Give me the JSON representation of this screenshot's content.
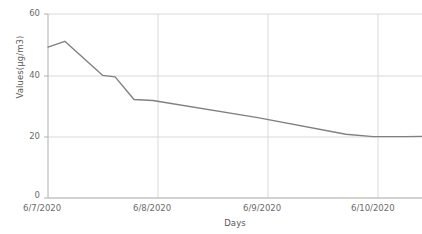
{
  "chart_data": {
    "type": "line",
    "title": "",
    "xlabel": "Days",
    "ylabel": "Values(µg/m3)",
    "grid": true,
    "legend": false,
    "line_color": "#808080",
    "grid_color": "#d9d9d9",
    "axis_color": "#a6a6a6",
    "text_color": "#6b6b6b",
    "background": "#ffffff",
    "xlim": [
      0,
      3.566
    ],
    "ylim": [
      0,
      60
    ],
    "yticks": [
      0,
      20,
      40,
      60
    ],
    "ytick_labels": [
      "0",
      "20",
      "40",
      "60"
    ],
    "xticks": [
      0,
      1,
      2,
      3
    ],
    "xtick_labels": [
      "6/7/2020",
      "6/8/2020",
      "6/9/2020",
      "6/10/2020"
    ],
    "x": [
      0.0,
      0.16,
      0.52,
      0.64,
      0.82,
      1.0,
      2.0,
      2.84,
      3.1,
      3.4,
      3.566
    ],
    "values": [
      49.2,
      51.1,
      40.0,
      39.5,
      32.1,
      31.8,
      26.2,
      20.8,
      20.0,
      20.0,
      20.1
    ],
    "series": [
      {
        "name": "Values",
        "points": [
          {
            "x": 0.0,
            "y": 49.2
          },
          {
            "x": 0.16,
            "y": 51.1
          },
          {
            "x": 0.52,
            "y": 40.0
          },
          {
            "x": 0.64,
            "y": 39.5
          },
          {
            "x": 0.82,
            "y": 32.1
          },
          {
            "x": 1.0,
            "y": 31.8
          },
          {
            "x": 2.0,
            "y": 26.2
          },
          {
            "x": 2.84,
            "y": 20.8
          },
          {
            "x": 3.1,
            "y": 20.0
          },
          {
            "x": 3.4,
            "y": 20.0
          },
          {
            "x": 3.566,
            "y": 20.1
          }
        ]
      }
    ]
  },
  "axes": {
    "y_title": "Values(µg/m3)",
    "x_title": "Days"
  },
  "ytick_0": "0",
  "ytick_1": "20",
  "ytick_2": "40",
  "ytick_3": "60",
  "xtick_0": "6/7/2020",
  "xtick_1": "6/8/2020",
  "xtick_2": "6/9/2020",
  "xtick_3": "6/10/2020"
}
